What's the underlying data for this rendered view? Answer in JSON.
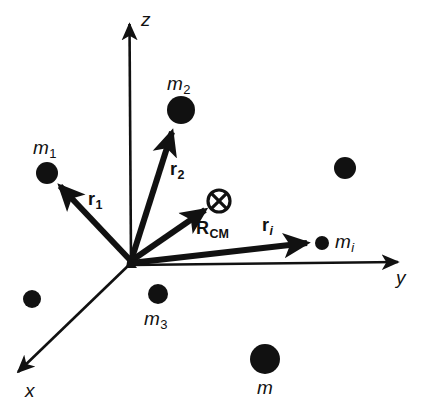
{
  "figure": {
    "background_color": "#ffffff",
    "ink_color": "#111111",
    "width": 437,
    "height": 403
  },
  "axes": {
    "origin": {
      "x": 131,
      "y": 261
    },
    "items": [
      {
        "name": "z",
        "label": "z",
        "label_x": 141,
        "label_y": 10,
        "tip": {
          "x": 129,
          "y": 17
        },
        "tail": {
          "x": 131,
          "y": 261
        }
      },
      {
        "name": "y",
        "label": "y",
        "label_x": 396,
        "label_y": 268,
        "tip": {
          "x": 406,
          "y": 262
        },
        "tail": {
          "x": 131,
          "y": 265
        }
      },
      {
        "name": "x",
        "label": "x",
        "label_x": 25,
        "label_y": 381,
        "tip": {
          "x": 11,
          "y": 379
        },
        "tail": {
          "x": 131,
          "y": 263
        }
      }
    ]
  },
  "vectors": [
    {
      "id": "r1",
      "label_main": "r",
      "label_sub": "1",
      "sub_italic": false,
      "label_x": 88,
      "label_y": 190,
      "tail": {
        "x": 131,
        "y": 261
      },
      "tip": {
        "x": 56,
        "y": 182
      },
      "stroke_width": 5.5
    },
    {
      "id": "r2",
      "label_main": "r",
      "label_sub": "2",
      "sub_italic": false,
      "label_x": 170,
      "label_y": 160,
      "tail": {
        "x": 131,
        "y": 261
      },
      "tip": {
        "x": 173,
        "y": 126
      },
      "stroke_width": 5.5
    },
    {
      "id": "Rcm",
      "label_main": "R",
      "label_sub": "CM",
      "sub_italic": false,
      "label_x": 196,
      "label_y": 219,
      "tail": {
        "x": 131,
        "y": 261
      },
      "tip": {
        "x": 210,
        "y": 206
      },
      "stroke_width": 5.5
    },
    {
      "id": "ri",
      "label_main": "r",
      "label_sub": "i",
      "sub_italic": true,
      "label_x": 262,
      "label_y": 216,
      "tail": {
        "x": 131,
        "y": 263
      },
      "tip": {
        "x": 313,
        "y": 243
      },
      "stroke_width": 5.5
    }
  ],
  "masses": [
    {
      "id": "m1",
      "label_main": "m",
      "label_sub": "1",
      "sub_italic": false,
      "label_x": 33,
      "label_y": 138,
      "cx": 47,
      "cy": 173,
      "r": 11
    },
    {
      "id": "m2",
      "label_main": "m",
      "label_sub": "2",
      "sub_italic": false,
      "label_x": 167,
      "label_y": 74,
      "cx": 181,
      "cy": 110,
      "r": 14
    },
    {
      "id": "m3",
      "label_main": "m",
      "label_sub": "3",
      "sub_italic": false,
      "label_x": 144,
      "label_y": 309,
      "cx": 158,
      "cy": 294,
      "r": 10
    },
    {
      "id": "mi",
      "label_main": "m",
      "label_sub": "i",
      "sub_italic": true,
      "label_x": 335,
      "label_y": 232,
      "cx": 322,
      "cy": 243,
      "r": 7
    },
    {
      "id": "m",
      "label_main": "m",
      "label_sub": "",
      "sub_italic": false,
      "label_x": 257,
      "label_y": 378,
      "cx": 265,
      "cy": 359,
      "r": 15
    }
  ],
  "unlabeled_masses": [
    {
      "id": "dot-upper-right",
      "cx": 345,
      "cy": 168,
      "r": 11
    },
    {
      "id": "dot-lower-left",
      "cx": 32,
      "cy": 299,
      "r": 9
    }
  ],
  "center_of_mass_marker": {
    "id": "cm-crossed-circle",
    "cx": 219,
    "cy": 201,
    "r": 11,
    "stroke_width": 3
  }
}
